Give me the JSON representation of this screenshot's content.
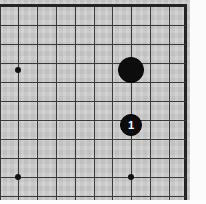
{
  "diagram": {
    "board_label": "goban",
    "colors": {
      "board": "#cdcdcd",
      "grid_line": "#3a3a3a",
      "border_line": "#242424",
      "black_stone": "#0d0d0d",
      "white_stone": "#f6f6f6",
      "label_on_black": "#ffffff",
      "paper_margin": "#fbfbfb"
    },
    "geometry": {
      "cell_size": 18.8,
      "origin_x": 18,
      "origin_y": 6,
      "board_width": 190,
      "board_height": 204
    },
    "grid": {
      "vertical_lines": [
        {
          "name": "line-v-0",
          "x": 0,
          "edge": false
        },
        {
          "name": "line-v-1",
          "x": 18,
          "edge": false
        },
        {
          "name": "line-v-2",
          "x": 37,
          "edge": false
        },
        {
          "name": "line-v-3",
          "x": 56,
          "edge": false
        },
        {
          "name": "line-v-4",
          "x": 75,
          "edge": false
        },
        {
          "name": "line-v-5",
          "x": 94,
          "edge": false
        },
        {
          "name": "line-v-6",
          "x": 112,
          "edge": false
        },
        {
          "name": "line-v-7",
          "x": 131,
          "edge": false
        },
        {
          "name": "line-v-8",
          "x": 150,
          "edge": false
        },
        {
          "name": "line-v-9",
          "x": 169,
          "edge": false
        },
        {
          "name": "line-v-edge-right",
          "x": 184,
          "edge": true
        }
      ],
      "horizontal_lines": [
        {
          "name": "line-h-edge-top",
          "y": 4,
          "edge": true
        },
        {
          "name": "line-h-1",
          "y": 25,
          "edge": false
        },
        {
          "name": "line-h-2",
          "y": 44,
          "edge": false
        },
        {
          "name": "line-h-3",
          "y": 63,
          "edge": false
        },
        {
          "name": "line-h-4",
          "y": 82,
          "edge": false
        },
        {
          "name": "line-h-5",
          "y": 101,
          "edge": false
        },
        {
          "name": "line-h-6",
          "y": 120,
          "edge": false
        },
        {
          "name": "line-h-7",
          "y": 139,
          "edge": false
        },
        {
          "name": "line-h-8",
          "y": 158,
          "edge": false
        },
        {
          "name": "line-h-9",
          "y": 177,
          "edge": false
        },
        {
          "name": "line-h-10",
          "y": 196,
          "edge": false
        }
      ]
    },
    "star_points": [
      {
        "name": "hoshi-left-upper",
        "x": 18,
        "y": 70
      },
      {
        "name": "hoshi-left-lower",
        "x": 18,
        "y": 177
      },
      {
        "name": "hoshi-center-lower",
        "x": 131,
        "y": 177
      }
    ],
    "stones": [
      {
        "name": "black-stone-unnumbered",
        "color": "black",
        "x": 131,
        "y": 70,
        "radius": 13,
        "label": ""
      },
      {
        "name": "black-stone-move-1",
        "color": "black",
        "x": 131,
        "y": 125,
        "radius": 11,
        "label": "1"
      }
    ]
  }
}
